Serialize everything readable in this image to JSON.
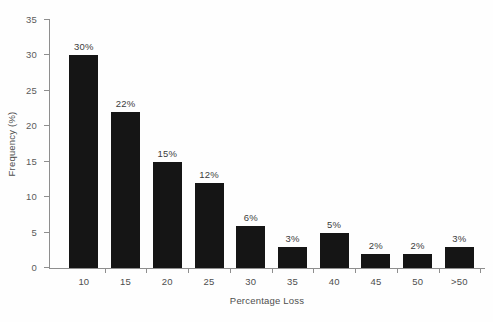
{
  "chart_data": {
    "type": "bar",
    "title": "",
    "subtitle": "",
    "xlabel": "Percentage Loss",
    "ylabel": "Frequency (%)",
    "categories": [
      "10",
      "15",
      "20",
      "25",
      "30",
      "35",
      "40",
      "45",
      "50",
      ">50"
    ],
    "values": [
      30,
      22,
      15,
      12,
      6,
      3,
      5,
      2,
      2,
      3
    ],
    "data_labels": [
      "30%",
      "22%",
      "15%",
      "12%",
      "6%",
      "3%",
      "5%",
      "2%",
      "2%",
      "3%"
    ],
    "ylim": [
      0,
      35
    ],
    "ytick_values": [
      0,
      5,
      10,
      15,
      20,
      25,
      30,
      35
    ],
    "ytick_labels": [
      "0",
      "5",
      "10",
      "15",
      "20",
      "25",
      "30",
      "35"
    ],
    "grid": false,
    "legend": null,
    "legend_position": "none",
    "bar_color": "#151515",
    "axis_color": "#8e8e8e",
    "text_color": "#4e4e4e",
    "background_color": "#fefefe"
  }
}
